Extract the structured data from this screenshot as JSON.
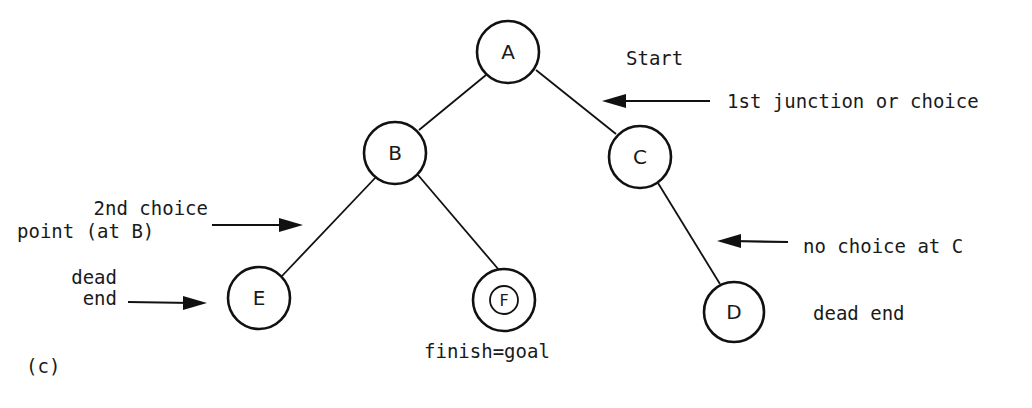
{
  "figure_label": "(c)",
  "nodes": {
    "A": {
      "label": "A"
    },
    "B": {
      "label": "B"
    },
    "C": {
      "label": "C"
    },
    "D": {
      "label": "D"
    },
    "E": {
      "label": "E"
    },
    "F": {
      "label": "F"
    }
  },
  "edges": [
    {
      "from": "A",
      "to": "B"
    },
    {
      "from": "A",
      "to": "C"
    },
    {
      "from": "B",
      "to": "E"
    },
    {
      "from": "B",
      "to": "F"
    },
    {
      "from": "C",
      "to": "D"
    }
  ],
  "annotations": {
    "start": "Start",
    "first_junction": "1st junction or choice",
    "second_choice_line1": "2nd choice",
    "second_choice_line2": "point (at B)",
    "dead_end_e_line1": "dead",
    "dead_end_e_line2": "end",
    "no_choice_c": "no choice at C",
    "dead_end_d": "dead end",
    "finish_goal": "finish=goal"
  },
  "colors": {
    "ink": "#111111",
    "background": "#ffffff"
  }
}
